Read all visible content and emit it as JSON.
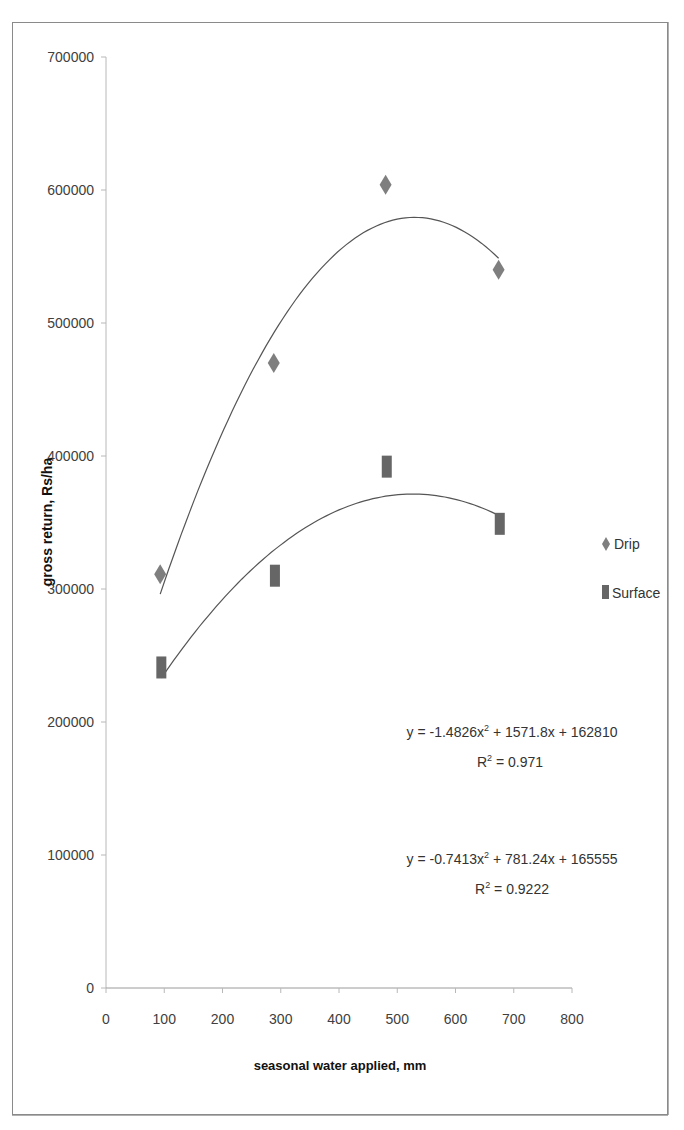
{
  "chart_data": {
    "type": "scatter",
    "title": "",
    "xlabel": "seasonal water applied, mm",
    "ylabel": "gross return, Rs/ha",
    "xlim": [
      0,
      800
    ],
    "ylim": [
      0,
      700000
    ],
    "x_ticks": [
      "0",
      "100",
      "200",
      "300",
      "400",
      "500",
      "600",
      "700",
      "800"
    ],
    "y_ticks": [
      "0",
      "100000",
      "200000",
      "300000",
      "400000",
      "500000",
      "600000",
      "700000"
    ],
    "grid": false,
    "legend_position": "right",
    "series": [
      {
        "name": "Drip",
        "marker": "diamond",
        "color": "#7f7f7f",
        "x": [
          93,
          288,
          480,
          674
        ],
        "y": [
          311000,
          470000,
          604000,
          540000
        ],
        "trendline": {
          "type": "polynomial-2",
          "equation": "y = -1.4826x² + 1571.8x + 162810",
          "r2": "R² = 0.971",
          "coefficients": [
            -1.4826,
            1571.8,
            162810
          ]
        }
      },
      {
        "name": "Surface",
        "marker": "square",
        "color": "#666666",
        "x": [
          95,
          290,
          482,
          676
        ],
        "y": [
          241000,
          310000,
          392000,
          349000
        ],
        "trendline": {
          "type": "polynomial-2",
          "equation": "y = -0.7413x² + 781.24x + 165555",
          "r2": "R² = 0.9222",
          "coefficients": [
            -0.7413,
            781.24,
            165555
          ]
        }
      }
    ]
  },
  "legend": {
    "items": [
      {
        "label": "Drip",
        "icon": "diamond-marker-icon"
      },
      {
        "label": "Surface",
        "icon": "square-marker-icon"
      }
    ]
  },
  "annotations": {
    "drip_equation": "y = -1.4826x",
    "drip_eq_rest": " + 1571.8x + 162810",
    "drip_r2_prefix": "R",
    "drip_r2_rest": " = 0.971",
    "surface_equation": "y = -0.7413x",
    "surface_eq_rest": " + 781.24x + 165555",
    "surface_r2_prefix": "R",
    "surface_r2_rest": " = 0.9222",
    "sup": "2"
  }
}
